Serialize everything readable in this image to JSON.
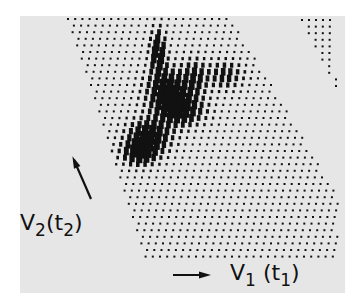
{
  "figure": {
    "type": "2D contour stacked plot (dot lattice)",
    "background_color": "#e6e6e6",
    "ink_color": "#111111",
    "axis_labels": {
      "vertical": {
        "symbol": "V",
        "subscript": "2",
        "paren_open": "(",
        "var": "t",
        "var_subscript": "2",
        "paren_close": ")"
      },
      "horizontal": {
        "symbol": "V",
        "subscript": "1",
        "paren_open": "(",
        "var": "t",
        "var_subscript": "1",
        "paren_close": ")"
      }
    },
    "arrows": {
      "vertical": "arrow pointing up-left toward lattice",
      "horizontal": "arrow pointing right"
    },
    "features": [
      "slanted parallelogram lattice of dots",
      "dark elongated peak cluster in center",
      "secondary peak cluster to the right of center",
      "small triangular dot region at top-right corner"
    ]
  }
}
